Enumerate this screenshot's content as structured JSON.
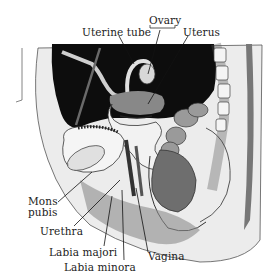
{
  "diagram": {
    "labels": {
      "uterine_tube": "Uterine tube",
      "ovary": "Ovary",
      "uterus": "Uterus",
      "mons_pubis_line1": "Mons",
      "mons_pubis_line2": "pubis",
      "urethra": "Urethra",
      "labia_majori": "Labia majori",
      "labia_minora": "Labia minora",
      "vagina": "Vagina"
    },
    "colors": {
      "background": "#ffffff",
      "cavity": "#0d0d0d",
      "ink": "#222222",
      "tissue": "#e8e8e8",
      "shade": "#8a8a8a"
    }
  }
}
